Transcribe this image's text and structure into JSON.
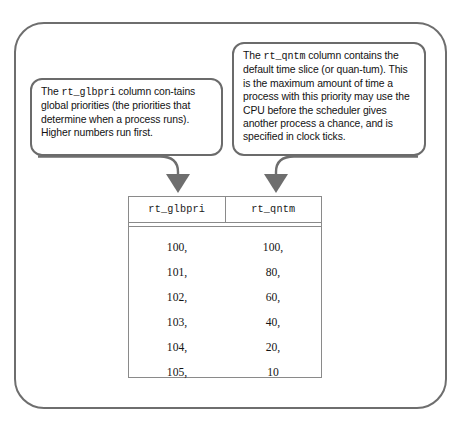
{
  "figure": {
    "name": "rt_dptbl-priority-quantum-table-diagram",
    "frame": {
      "border_color": "#6e6e6e"
    }
  },
  "callouts": [
    {
      "id": "glbpri",
      "lead_text": "The ",
      "code_term": "rt_glbpri",
      "body_text": " column con-tains global priorities (the priorities that determine when a process runs). Higher numbers run first.",
      "target_column": "rt_glbpri",
      "border_color": "#6b6b6b"
    },
    {
      "id": "qntm",
      "lead_text": "The ",
      "code_term": "rt_qntm",
      "body_text": " column contains the default time slice (or quan-tum). This is the maximum amount of time a process with this priority may use the CPU before the scheduler gives another process a chance, and is specified in clock ticks.",
      "target_column": "rt_qntm",
      "border_color": "#6b6b6b"
    }
  ],
  "table": {
    "columns": [
      "rt_glbpri",
      "rt_qntm"
    ],
    "rows": [
      [
        "100,",
        "100,"
      ],
      [
        "101,",
        "80,"
      ],
      [
        "102,",
        "60,"
      ],
      [
        "103,",
        "40,"
      ],
      [
        "104,",
        "20,"
      ],
      [
        "105,",
        "10"
      ]
    ],
    "border_color": "#8a8a8a"
  },
  "arrows": [
    {
      "name": "arrow-to-rt_glbpri",
      "color": "#6e6e6e"
    },
    {
      "name": "arrow-to-rt_qntm",
      "color": "#6e6e6e"
    }
  ]
}
